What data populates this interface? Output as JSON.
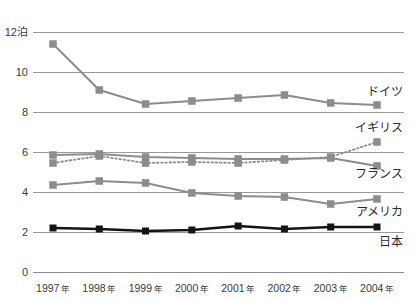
{
  "chart_data": {
    "type": "line",
    "title": "",
    "subtitle": "",
    "xlabel": "",
    "ylabel": "泊",
    "y_unit_label": "12泊",
    "ylim": [
      0,
      12
    ],
    "yticks": [
      0,
      2,
      4,
      6,
      8,
      10,
      12
    ],
    "ytick_labels": [
      "0",
      "2",
      "4",
      "6",
      "8",
      "10",
      "12泊"
    ],
    "grid": true,
    "grid_axis": "y",
    "legend_position": "right-inline",
    "categories": [
      "1997",
      "1998",
      "1999",
      "2000",
      "2001",
      "2002",
      "2003",
      "2004"
    ],
    "xtick_labels": [
      "1997 年",
      "1998 年",
      "1999 年",
      "2000 年",
      "2001 年",
      "2002 年",
      "2003 年",
      "2004 年"
    ],
    "xtick_year": [
      "1997",
      "1998",
      "1999",
      "2000",
      "2001",
      "2002",
      "2003",
      "2004"
    ],
    "xtick_suffix": "年",
    "series": [
      {
        "name": "ドイツ",
        "label": "ドイツ",
        "color": "#8c8c8c",
        "line_style": "solid",
        "marker": "square",
        "values": [
          11.4,
          9.1,
          8.4,
          8.55,
          8.7,
          8.85,
          8.45,
          8.35
        ],
        "label_x": 2004,
        "label_y": 9.0
      },
      {
        "name": "イギリス",
        "label": "イギリス",
        "color": "#8c8c8c",
        "line_style": "dotted",
        "marker": "square",
        "values": [
          5.45,
          5.8,
          5.45,
          5.5,
          5.45,
          5.6,
          5.75,
          6.5
        ],
        "label_x": 2004,
        "label_y": 7.2
      },
      {
        "name": "フランス",
        "label": "フランス",
        "color": "#8c8c8c",
        "line_style": "solid",
        "marker": "square",
        "values": [
          5.85,
          5.9,
          5.75,
          5.7,
          5.65,
          5.65,
          5.7,
          5.3
        ],
        "label_x": 2004,
        "label_y": 4.9
      },
      {
        "name": "アメリカ",
        "label": "アメリカ",
        "color": "#8c8c8c",
        "line_style": "solid",
        "marker": "square",
        "values": [
          4.35,
          4.55,
          4.45,
          3.95,
          3.8,
          3.75,
          3.4,
          3.65
        ],
        "label_x": 2004,
        "label_y": 3.0
      },
      {
        "name": "日本",
        "label": "日本",
        "color": "#141414",
        "line_style": "solid",
        "marker": "square",
        "values": [
          2.2,
          2.15,
          2.05,
          2.1,
          2.3,
          2.15,
          2.25,
          2.25
        ],
        "label_x": 2004,
        "label_y": 1.5
      }
    ]
  }
}
